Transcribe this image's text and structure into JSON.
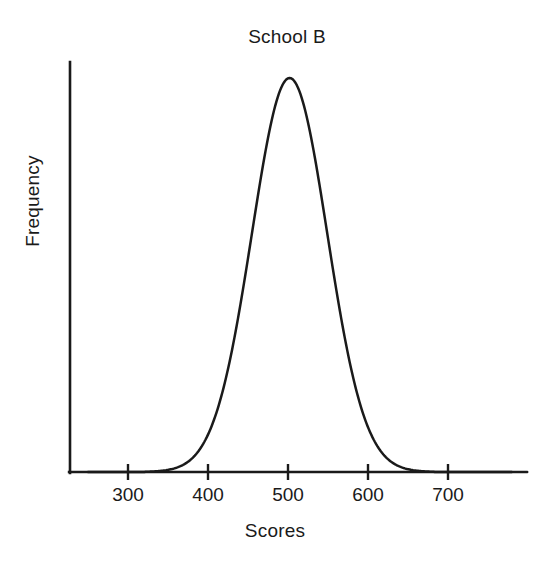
{
  "chart_data": {
    "type": "line",
    "title": "School B",
    "xlabel": "Scores",
    "ylabel": "Frequency",
    "grid": false,
    "legend": null,
    "xlim": [
      250,
      800
    ],
    "ylim": [
      0,
      1.05
    ],
    "x_ticks": [
      300,
      400,
      500,
      600,
      700
    ],
    "x_tick_labels": [
      "300",
      "400",
      "500",
      "600",
      "700"
    ],
    "y_ticks": [],
    "y_tick_labels": [],
    "distribution": {
      "shape": "normal",
      "mean": 502,
      "sigma": 47,
      "peak_value": 1.0,
      "left_tail_touches_axis_at": 328,
      "right_tail_touches_axis_at": 671
    },
    "x": [
      250,
      270,
      290,
      300,
      310,
      320,
      330,
      340,
      350,
      360,
      370,
      380,
      390,
      400,
      410,
      420,
      430,
      440,
      450,
      460,
      470,
      480,
      490,
      500,
      502,
      510,
      520,
      530,
      540,
      550,
      560,
      570,
      580,
      590,
      600,
      610,
      620,
      630,
      640,
      650,
      660,
      670,
      680,
      700,
      720,
      760,
      800
    ],
    "y": [
      0.0,
      0.0,
      0.001,
      0.002,
      0.004,
      0.008,
      0.015,
      0.026,
      0.044,
      0.072,
      0.112,
      0.166,
      0.236,
      0.321,
      0.419,
      0.525,
      0.632,
      0.733,
      0.82,
      0.89,
      0.943,
      0.978,
      0.996,
      1.0,
      1.0,
      0.996,
      0.979,
      0.945,
      0.893,
      0.824,
      0.741,
      0.647,
      0.548,
      0.447,
      0.351,
      0.264,
      0.19,
      0.131,
      0.087,
      0.055,
      0.033,
      0.019,
      0.011,
      0.003,
      0.001,
      0.0,
      0.0
    ],
    "colors": {
      "curve": "#1a1a1a",
      "axis": "#1a1a1a",
      "background": "#ffffff"
    }
  },
  "axes": {
    "x_tick_labels": [
      "300",
      "400",
      "500",
      "600",
      "700"
    ]
  }
}
